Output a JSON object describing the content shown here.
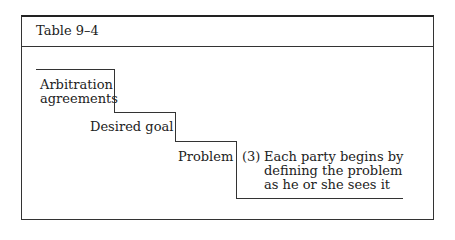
{
  "table": {
    "title": "Table 9–4",
    "steps": [
      {
        "line1": "Arbitration",
        "line2": "agreements"
      },
      {
        "label": "Desired goal"
      },
      {
        "label": "Problem"
      }
    ],
    "note": {
      "number": "(3)",
      "lines": [
        "Each party begins by",
        "defining the problem",
        "as he or she sees it"
      ]
    }
  }
}
